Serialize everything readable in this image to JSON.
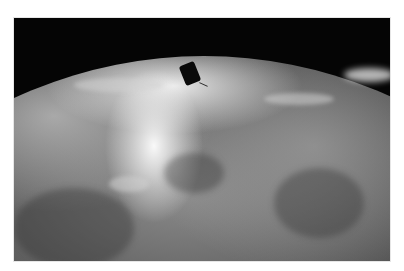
{
  "image": {
    "description": "Grayscale photograph of Earth's curved horizon seen from orbit with a small dark satellite silhouetted above bright cloud cover against black space",
    "elements": [
      "space-background",
      "earth-horizon",
      "cloud-cover",
      "satellite"
    ],
    "colors": {
      "space": "#050505",
      "bright_clouds": "#f0f0f0",
      "ocean_mid": "#7a7a7a",
      "ocean_dark": "#2a2a2a",
      "satellite": "#0a0a0a",
      "page_background": "#ffffff"
    }
  }
}
